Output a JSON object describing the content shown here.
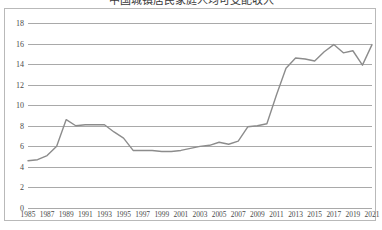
{
  "title": {
    "text": "中国城镇居民家庭人均可支配收入",
    "clipped": true
  },
  "chart": {
    "line_color": "#8c8c8c",
    "grid_color": "#a9a9a9",
    "frame_color": "#b9b9b9",
    "background": "#ffffff"
  },
  "chart_data": {
    "type": "line",
    "title": "",
    "xlabel": "",
    "ylabel": "",
    "ylim": [
      0,
      18
    ],
    "ytick_step": 2,
    "yticks": [
      18,
      16,
      14,
      12,
      10,
      8,
      6,
      4,
      2,
      0
    ],
    "ytick_labels": [
      "18",
      "16",
      "14",
      "12",
      "10",
      "8",
      "6",
      "4",
      "2",
      "0"
    ],
    "grid": "horizontal",
    "legend": "none",
    "xlim": [
      1985,
      2021
    ],
    "xtick_labels": [
      "1985",
      "1987",
      "1989",
      "1991",
      "1993",
      "1995",
      "1997",
      "1999",
      "2001",
      "2003",
      "2005",
      "2007",
      "2009",
      "2011",
      "2013",
      "2015",
      "2017",
      "2019",
      "2021"
    ],
    "x": [
      1985,
      1986,
      1987,
      1988,
      1989,
      1990,
      1991,
      1992,
      1993,
      1994,
      1995,
      1996,
      1997,
      1998,
      1999,
      2000,
      2001,
      2002,
      2003,
      2004,
      2005,
      2006,
      2007,
      2008,
      2009,
      2010,
      2011,
      2012,
      2013,
      2014,
      2015,
      2016,
      2017,
      2018,
      2019,
      2020,
      2021
    ],
    "series": [
      {
        "name": "series-1",
        "values": [
          4.6,
          4.7,
          5.1,
          6.0,
          8.6,
          8.0,
          8.1,
          8.1,
          8.1,
          7.4,
          6.8,
          5.6,
          5.6,
          5.6,
          5.5,
          5.5,
          5.6,
          5.8,
          6.0,
          6.1,
          6.4,
          6.2,
          6.5,
          7.9,
          8.0,
          8.2,
          11.0,
          13.6,
          14.6,
          14.5,
          14.3,
          15.2,
          15.9,
          15.1,
          15.3,
          13.9,
          15.9
        ]
      }
    ]
  }
}
